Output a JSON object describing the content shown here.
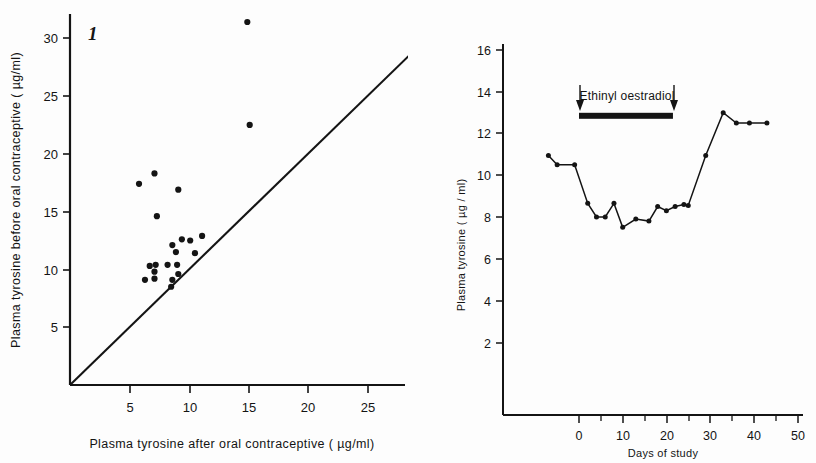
{
  "figure": {
    "panel_label": "1"
  },
  "chart_data": [
    {
      "type": "scatter",
      "id": "plasma-tyrosine-before-vs-after",
      "title": "",
      "xlabel": "Plasma tyrosine after oral contraceptive ( µg/ml)",
      "ylabel": "Plasma  tyrosine  before oral  contraceptive ( µg/ml)",
      "xlim": [
        0,
        32
      ],
      "ylim": [
        0,
        32
      ],
      "xticks": [
        5,
        10,
        15,
        20,
        25,
        30
      ],
      "yticks": [
        5,
        10,
        15,
        20,
        25,
        30
      ],
      "xticklabels": [
        "5",
        "10",
        "15",
        "20",
        "25",
        "30"
      ],
      "yticklabels": [
        "5",
        "10",
        "15",
        "20",
        "25",
        "30"
      ],
      "grid": false,
      "legend": false,
      "reference_line": {
        "name": "line-of-identity",
        "from": [
          0,
          0
        ],
        "to": [
          32,
          32
        ]
      },
      "points": [
        [
          14.9,
          31.4
        ],
        [
          15.1,
          22.5
        ],
        [
          7.1,
          18.3
        ],
        [
          5.8,
          17.4
        ],
        [
          9.1,
          16.9
        ],
        [
          7.3,
          14.6
        ],
        [
          9.4,
          12.6
        ],
        [
          10.1,
          12.5
        ],
        [
          11.1,
          12.9
        ],
        [
          8.6,
          12.1
        ],
        [
          8.9,
          11.5
        ],
        [
          10.5,
          11.4
        ],
        [
          8.2,
          10.4
        ],
        [
          9.0,
          10.4
        ],
        [
          7.2,
          10.4
        ],
        [
          6.7,
          10.3
        ],
        [
          7.1,
          9.8
        ],
        [
          9.1,
          9.6
        ],
        [
          6.3,
          9.1
        ],
        [
          7.1,
          9.2
        ],
        [
          8.6,
          9.1
        ],
        [
          8.5,
          8.5
        ]
      ]
    },
    {
      "type": "line",
      "id": "plasma-tyrosine-vs-days",
      "title": "",
      "xlabel": "Days  of study",
      "ylabel": "Plasma  tyrosine  ( µg / ml)",
      "xlim": [
        -8,
        50
      ],
      "ylim": [
        0,
        16
      ],
      "xticks": [
        0,
        5,
        10,
        15,
        20,
        25,
        30,
        35,
        40,
        45,
        50
      ],
      "xticklabels": [
        "0",
        "",
        "10",
        "",
        "20",
        "",
        "30",
        "",
        "40",
        "",
        "50"
      ],
      "yticks": [
        2,
        4,
        6,
        8,
        10,
        12,
        14,
        16
      ],
      "yticklabels": [
        "2",
        "4",
        "6",
        "8",
        "10",
        "12",
        "14",
        "16"
      ],
      "grid": false,
      "legend": false,
      "series": [
        {
          "name": "plasma tyrosine",
          "x": [
            -7,
            -5,
            -1,
            2,
            4,
            6,
            8,
            10,
            13,
            16,
            18,
            20,
            22,
            24,
            25,
            29,
            33,
            36,
            39,
            43
          ],
          "y": [
            12.45,
            12.0,
            12.0,
            10.15,
            9.5,
            9.5,
            10.15,
            9.0,
            9.4,
            9.3,
            10.0,
            9.8,
            10.0,
            10.1,
            10.05,
            12.45,
            14.5,
            14.0,
            14.0,
            14.0
          ]
        }
      ],
      "annotations": [
        {
          "name": "treatment-label",
          "text": "Ethinyl oestradiol",
          "x_center": 11,
          "y": 15.1
        },
        {
          "name": "treatment-bar",
          "from_x": 0,
          "to_x": 21.5,
          "y": 14.35
        }
      ]
    }
  ]
}
